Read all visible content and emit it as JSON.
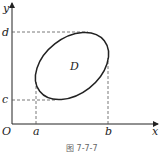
{
  "diagram": {
    "axes": {
      "x_label": "x",
      "y_label": "y",
      "origin_label": "O"
    },
    "ticks": {
      "a": "a",
      "b": "b",
      "c": "c",
      "d": "d"
    },
    "region_label": "D",
    "caption": "图 7-7-7",
    "colors": {
      "stroke": "#222222",
      "dashed": "#555555",
      "caption": "#666666"
    }
  }
}
